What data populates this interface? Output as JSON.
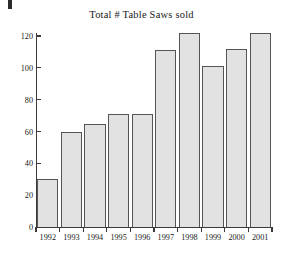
{
  "chart_data": {
    "type": "bar",
    "title": "Total # Table Saws sold",
    "xlabel": "",
    "ylabel": "",
    "categories": [
      "1992",
      "1993",
      "1994",
      "1995",
      "1996",
      "1997",
      "1998",
      "1999",
      "2000",
      "2001"
    ],
    "values": [
      30,
      60,
      65,
      71,
      71,
      111,
      122,
      101,
      112,
      122
    ],
    "ylim": [
      0,
      120
    ],
    "ytick_values": [
      0,
      20,
      40,
      60,
      80,
      100,
      120
    ],
    "ytick_labels": [
      "0",
      "20",
      "40",
      "60",
      "80",
      "100",
      "120"
    ],
    "grid": false,
    "legend": "none",
    "bar_fill_color": "#e2e2e2",
    "bar_border_color": "#555555",
    "axis_color": "#3a3a3a",
    "background_color": "#ffffff"
  }
}
